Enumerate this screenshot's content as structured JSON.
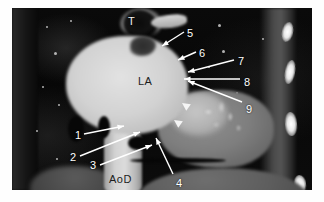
{
  "figure": {
    "modality_view": "cardiac axial tomographic section",
    "background_color": "#ffffff",
    "scan_background_color": "#050505"
  },
  "structure_labels": [
    {
      "text": "T",
      "name": "trachea-label",
      "x": 116,
      "y": 8,
      "style": "light"
    },
    {
      "text": "LA",
      "name": "left-atrium-label",
      "x": 126,
      "y": 68,
      "style": "dark"
    },
    {
      "text": "AoD",
      "name": "descending-aorta-label",
      "x": 97,
      "y": 166,
      "style": "dark"
    }
  ],
  "numeric_markers": [
    {
      "number": "1",
      "name": "marker-1",
      "x": 63,
      "y": 122
    },
    {
      "number": "2",
      "name": "marker-2",
      "x": 58,
      "y": 144
    },
    {
      "number": "3",
      "name": "marker-3",
      "x": 78,
      "y": 152
    },
    {
      "number": "4",
      "name": "marker-4",
      "x": 164,
      "y": 170
    },
    {
      "number": "5",
      "name": "marker-5",
      "x": 175,
      "y": 20
    },
    {
      "number": "6",
      "name": "marker-6",
      "x": 187,
      "y": 40
    },
    {
      "number": "7",
      "name": "marker-7",
      "x": 226,
      "y": 48
    },
    {
      "number": "8",
      "name": "marker-8",
      "x": 232,
      "y": 69
    },
    {
      "number": "9",
      "name": "marker-9",
      "x": 234,
      "y": 96
    }
  ],
  "leader_arrows": [
    {
      "name": "arrow-1",
      "x1": 72,
      "y1": 126,
      "x2": 112,
      "y2": 118
    },
    {
      "name": "arrow-2",
      "x1": 68,
      "y1": 148,
      "x2": 128,
      "y2": 124
    },
    {
      "name": "arrow-3",
      "x1": 88,
      "y1": 157,
      "x2": 140,
      "y2": 137
    },
    {
      "name": "arrow-4",
      "x1": 161,
      "y1": 166,
      "x2": 144,
      "y2": 130
    },
    {
      "name": "arrow-5",
      "x1": 172,
      "y1": 24,
      "x2": 150,
      "y2": 38
    },
    {
      "name": "arrow-6",
      "x1": 184,
      "y1": 44,
      "x2": 166,
      "y2": 52
    },
    {
      "name": "arrow-7",
      "x1": 222,
      "y1": 52,
      "x2": 176,
      "y2": 64
    },
    {
      "name": "arrow-8",
      "x1": 228,
      "y1": 71,
      "x2": 172,
      "y2": 71
    },
    {
      "name": "arrow-9",
      "x1": 230,
      "y1": 94,
      "x2": 176,
      "y2": 73
    }
  ],
  "arrowheads": [
    {
      "name": "arrowhead-upper",
      "x": 170,
      "y": 95,
      "rotation": 215
    },
    {
      "name": "arrowhead-lower",
      "x": 162,
      "y": 112,
      "rotation": 215
    }
  ],
  "ribs": [
    {
      "name": "rib-1",
      "x": 270,
      "y": 14,
      "w": 11,
      "h": 20,
      "rot": 12
    },
    {
      "name": "rib-2",
      "x": 273,
      "y": 52,
      "w": 10,
      "h": 24,
      "rot": 10
    },
    {
      "name": "rib-3",
      "x": 273,
      "y": 104,
      "w": 12,
      "h": 24,
      "rot": -4
    },
    {
      "name": "rib-4",
      "x": 282,
      "y": 167,
      "w": 12,
      "h": 18,
      "rot": -6
    }
  ],
  "specks": [
    {
      "x": 34,
      "y": 18,
      "d": 2
    },
    {
      "x": 58,
      "y": 12,
      "d": 2
    },
    {
      "x": 42,
      "y": 44,
      "d": 3
    },
    {
      "x": 30,
      "y": 78,
      "d": 2
    },
    {
      "x": 46,
      "y": 96,
      "d": 2
    },
    {
      "x": 24,
      "y": 122,
      "d": 2
    },
    {
      "x": 44,
      "y": 150,
      "d": 2
    },
    {
      "x": 206,
      "y": 16,
      "d": 3
    },
    {
      "x": 210,
      "y": 42,
      "d": 3
    },
    {
      "x": 196,
      "y": 58,
      "d": 2
    },
    {
      "x": 224,
      "y": 84,
      "d": 2
    },
    {
      "x": 250,
      "y": 30,
      "d": 2
    },
    {
      "x": 160,
      "y": 176,
      "d": 2
    },
    {
      "x": 60,
      "y": 64,
      "d": 3
    }
  ]
}
